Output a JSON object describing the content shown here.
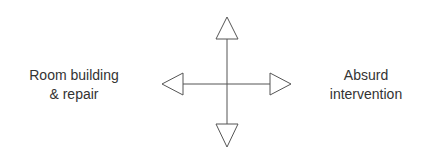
{
  "diagram": {
    "type": "axis-cross",
    "left_label_line1": "Room building",
    "left_label_line2": "& repair",
    "right_label_line1": "Absurd",
    "right_label_line2": "intervention",
    "top_label": "",
    "bottom_label": "",
    "stroke_color": "#555555",
    "text_color": "#333333"
  }
}
